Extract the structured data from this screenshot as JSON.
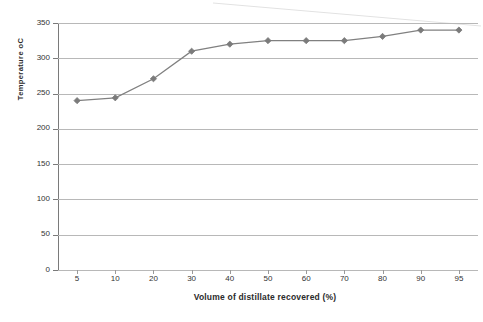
{
  "chart_data": {
    "type": "line",
    "title": "",
    "subtitle": "",
    "xlabel": "Volume of distillate recovered (%)",
    "ylabel": "Temperature oC",
    "categories": [
      "5",
      "10",
      "20",
      "30",
      "40",
      "50",
      "60",
      "70",
      "80",
      "90",
      "95"
    ],
    "x": [
      5,
      10,
      20,
      30,
      40,
      50,
      60,
      70,
      80,
      90,
      95
    ],
    "values": [
      240,
      244,
      271,
      310,
      320,
      325,
      325,
      325,
      331,
      340,
      340
    ],
    "series": [
      {
        "name": "Distillation curve",
        "values": [
          240,
          244,
          271,
          310,
          320,
          325,
          325,
          325,
          331,
          340,
          340
        ]
      }
    ],
    "ylim": [
      0,
      350
    ],
    "yticks": [
      0,
      50,
      100,
      150,
      200,
      250,
      300,
      350
    ],
    "ytick_labels": [
      "0",
      "50",
      "100",
      "150",
      "200",
      "250",
      "300",
      "350"
    ],
    "grid": "horizontal",
    "legend": "none",
    "marker": "diamond",
    "line_color": "#808080",
    "marker_color": "#7b7b7b",
    "grid_color": "#b8b8b8",
    "axis_color": "#7a7a7a",
    "background": "#ffffff"
  }
}
